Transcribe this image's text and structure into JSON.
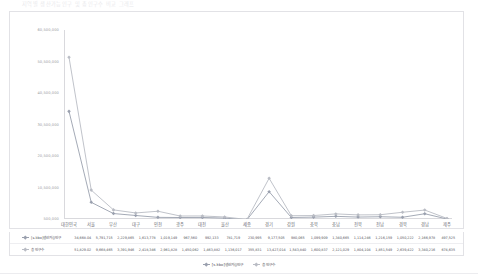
{
  "page": {
    "title": "지역별 생산가능인구 및 총인구수 비교 그래프"
  },
  "legend": {
    "items": [
      {
        "label": "[s.kbo]생산가능인구",
        "color": "#9aa0ae"
      },
      {
        "label": "총 인구수",
        "color": "#b9bcc4"
      }
    ]
  },
  "table": {
    "rows": [
      {
        "label": "[s.kbo]생산가능인구",
        "color": "#9aa0ae",
        "values": [
          "34,668.04",
          "5,791,715",
          "2,229,865",
          "1,613,778",
          "1,019,149",
          "967,560",
          "992,133",
          "781,719",
          "230,995",
          "9,177,505",
          "980,065",
          "1,099,909",
          "1,340,665",
          "1,114,246",
          "1,216,159",
          "1,050,222",
          "2,166,978",
          "497,525"
        ]
      },
      {
        "label": "총 인구수",
        "color": "#b9bcc4",
        "values": [
          "51,829.02",
          "9,668,465",
          "3,391,946",
          "2,418,346",
          "2,961,828",
          "1,450,062",
          "1,463,882",
          "1,136,017",
          "355,831",
          "13,427,014",
          "1,543,840",
          "1,600,837",
          "2,121,029",
          "1,804,104",
          "1,851,549",
          "2,639,422",
          "3,340,216",
          "674,635"
        ]
      }
    ]
  },
  "chart_data": {
    "type": "line",
    "title": "지역별 생산가능인구 및 총인구수 비교 그래프",
    "xlabel": "",
    "ylabel": "",
    "grid": false,
    "legend_position": "bottom",
    "ylim": [
      500000,
      60500000
    ],
    "yticks": [
      500000,
      10500000,
      20500000,
      30500000,
      40500000,
      50500000,
      60500000
    ],
    "ytick_labels": [
      "500,000",
      "10,500,000",
      "20,500,000",
      "30,500,000",
      "40,500,000",
      "50,500,000",
      "60,500,000"
    ],
    "categories": [
      "대한민국",
      "서울",
      "부산",
      "대구",
      "인천",
      "광주",
      "대전",
      "울산",
      "세종",
      "경기",
      "강원",
      "충북",
      "충남",
      "전북",
      "전남",
      "경북",
      "경남",
      "제주"
    ],
    "series": [
      {
        "name": "[s.kbo]생산가능인구",
        "color": "#9aa0ae",
        "values": [
          34668040,
          5791715,
          2229865,
          1613778,
          1019149,
          967560,
          992133,
          781719,
          230995,
          9177505,
          980065,
          1099909,
          1340665,
          1114246,
          1216159,
          1050222,
          2166978,
          497525
        ]
      },
      {
        "name": "총 인구수",
        "color": "#b9bcc4",
        "values": [
          51829020,
          9668465,
          3391946,
          2418346,
          2961828,
          1450062,
          1463882,
          1136017,
          355831,
          13427014,
          1543840,
          1600837,
          2121029,
          1804104,
          1851549,
          2639422,
          3340216,
          674635
        ]
      }
    ]
  }
}
